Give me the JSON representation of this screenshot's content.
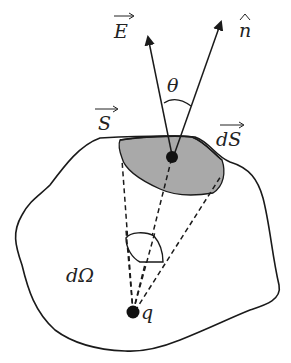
{
  "figure": {
    "colors": {
      "stroke": "#1a1a1a",
      "shaded_patch": "#a9a9a9",
      "background": "#ffffff"
    },
    "labels": {
      "electric_field": "E",
      "normal": "n",
      "angle": "θ",
      "surface": "S",
      "area_element": "dS",
      "solid_angle": "dΩ",
      "charge": "q"
    },
    "label_decorations": {
      "electric_field": "vector-arrow",
      "normal": "hat",
      "surface": "vector-arrow",
      "area_element": "vector-arrow"
    }
  }
}
